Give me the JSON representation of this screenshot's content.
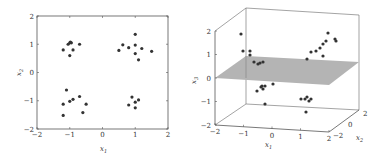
{
  "chart_data": [
    {
      "type": "scatter",
      "title": "",
      "xlabel": "x1",
      "ylabel": "x2",
      "xlim": [
        -2,
        2
      ],
      "ylim": [
        -2,
        2
      ],
      "xticks": [
        "-2",
        "-1",
        "0",
        "1",
        "2"
      ],
      "yticks": [
        "-2",
        "-1",
        "0",
        "1",
        "2"
      ],
      "grid": false,
      "points": [
        [
          -1.0,
          1.05
        ],
        [
          -1.05,
          1.0
        ],
        [
          -0.95,
          1.05
        ],
        [
          -0.98,
          1.08
        ],
        [
          -1.2,
          0.8
        ],
        [
          -0.9,
          0.8
        ],
        [
          -1.0,
          0.6
        ],
        [
          -0.7,
          1.0
        ],
        [
          0.5,
          0.78
        ],
        [
          0.62,
          0.98
        ],
        [
          0.8,
          0.88
        ],
        [
          1.0,
          1.35
        ],
        [
          1.0,
          0.97
        ],
        [
          1.0,
          0.67
        ],
        [
          1.1,
          0.45
        ],
        [
          1.2,
          0.85
        ],
        [
          1.5,
          0.75
        ],
        [
          -1.1,
          -0.62
        ],
        [
          -1.2,
          -1.12
        ],
        [
          -1.0,
          -1.02
        ],
        [
          -0.9,
          -0.95
        ],
        [
          -0.7,
          -0.85
        ],
        [
          -0.5,
          -1.12
        ],
        [
          -0.6,
          -1.42
        ],
        [
          -1.2,
          -1.52
        ],
        [
          0.9,
          -0.87
        ],
        [
          0.8,
          -1.15
        ],
        [
          1.0,
          -1.05
        ],
        [
          1.1,
          -0.97
        ],
        [
          1.0,
          -1.25
        ]
      ]
    },
    {
      "type": "scatter3d",
      "title": "",
      "xlabel": "x1",
      "ylabel": "x2",
      "zlabel": "x3",
      "xticks": [
        "-2",
        "-1",
        "0",
        "1",
        "2"
      ],
      "yticks": [
        "-2",
        "0",
        "2"
      ],
      "zticks": [
        "-2",
        "-1",
        "0",
        "1",
        "2"
      ],
      "plane": {
        "z": 0,
        "color": "#b4b4b4"
      },
      "points_screen": [
        [
          241,
          34
        ],
        [
          243,
          51
        ],
        [
          250,
          51
        ],
        [
          250,
          55
        ],
        [
          254,
          62
        ],
        [
          258,
          64
        ],
        [
          260,
          63
        ],
        [
          263,
          62
        ],
        [
          307,
          59
        ],
        [
          311,
          52
        ],
        [
          316,
          51
        ],
        [
          320,
          48
        ],
        [
          323,
          44
        ],
        [
          326,
          41
        ],
        [
          323,
          56
        ],
        [
          328,
          33
        ],
        [
          335,
          39
        ],
        [
          336,
          41
        ],
        [
          257,
          91
        ],
        [
          261,
          87
        ],
        [
          262,
          86
        ],
        [
          265,
          86
        ],
        [
          263,
          89
        ],
        [
          273,
          84
        ],
        [
          265,
          104
        ],
        [
          301,
          99
        ],
        [
          305,
          99
        ],
        [
          307,
          97
        ],
        [
          309,
          101
        ],
        [
          311,
          99
        ],
        [
          306,
          112
        ]
      ]
    }
  ]
}
